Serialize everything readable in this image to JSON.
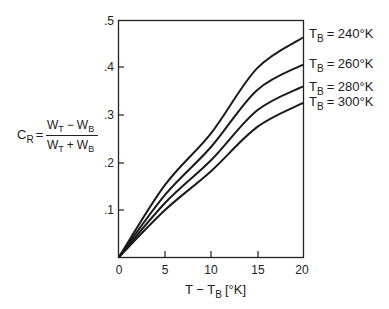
{
  "chart_data": {
    "type": "line",
    "title": "",
    "xlabel": "T − T_B [°K]",
    "ylabel": "C_R = (W_T − W_B) / (W_T + W_B)",
    "xlim": [
      0,
      20
    ],
    "ylim": [
      0,
      0.5
    ],
    "grid": false,
    "legend_position": "right, labels at curve ends",
    "x_ticks": [
      "0",
      "5",
      "10",
      "15",
      "20"
    ],
    "y_ticks": [
      ".1",
      ".2",
      ".3",
      ".4",
      ".5"
    ],
    "x": [
      0,
      5,
      10,
      15,
      20
    ],
    "series": [
      {
        "name": "T_B = 240°K",
        "values": [
          0,
          0.152,
          0.261,
          0.398,
          0.463
        ]
      },
      {
        "name": "T_B = 260°K",
        "values": [
          0,
          0.131,
          0.232,
          0.352,
          0.406
        ]
      },
      {
        "name": "T_B = 280°K",
        "values": [
          0,
          0.114,
          0.204,
          0.309,
          0.36
        ]
      },
      {
        "name": "T_B = 300°K",
        "values": [
          0,
          0.099,
          0.181,
          0.274,
          0.325
        ]
      }
    ]
  },
  "labels": {
    "y_axis": {
      "c": "C",
      "c_sub": "R",
      "eq": "=",
      "num_w1": "W",
      "num_s1": "T",
      "num_op": "−",
      "num_w2": "W",
      "num_s2": "B",
      "den_w1": "W",
      "den_s1": "T",
      "den_op": "+",
      "den_w2": "W",
      "den_s2": "B"
    },
    "x_axis": {
      "t": "T − T",
      "sub": "B",
      "unit": "[°K]"
    },
    "legend": [
      {
        "t": "T",
        "sub": "B",
        "rest": "= 240°K"
      },
      {
        "t": "T",
        "sub": "B",
        "rest": "= 260°K"
      },
      {
        "t": "T",
        "sub": "B",
        "rest": "= 280°K"
      },
      {
        "t": "T",
        "sub": "B",
        "rest": "= 300°K"
      }
    ],
    "x_ticks": [
      "0",
      "5",
      "10",
      "15",
      "20"
    ],
    "y_ticks": [
      ".1",
      ".2",
      ".3",
      ".4",
      ".5"
    ]
  }
}
